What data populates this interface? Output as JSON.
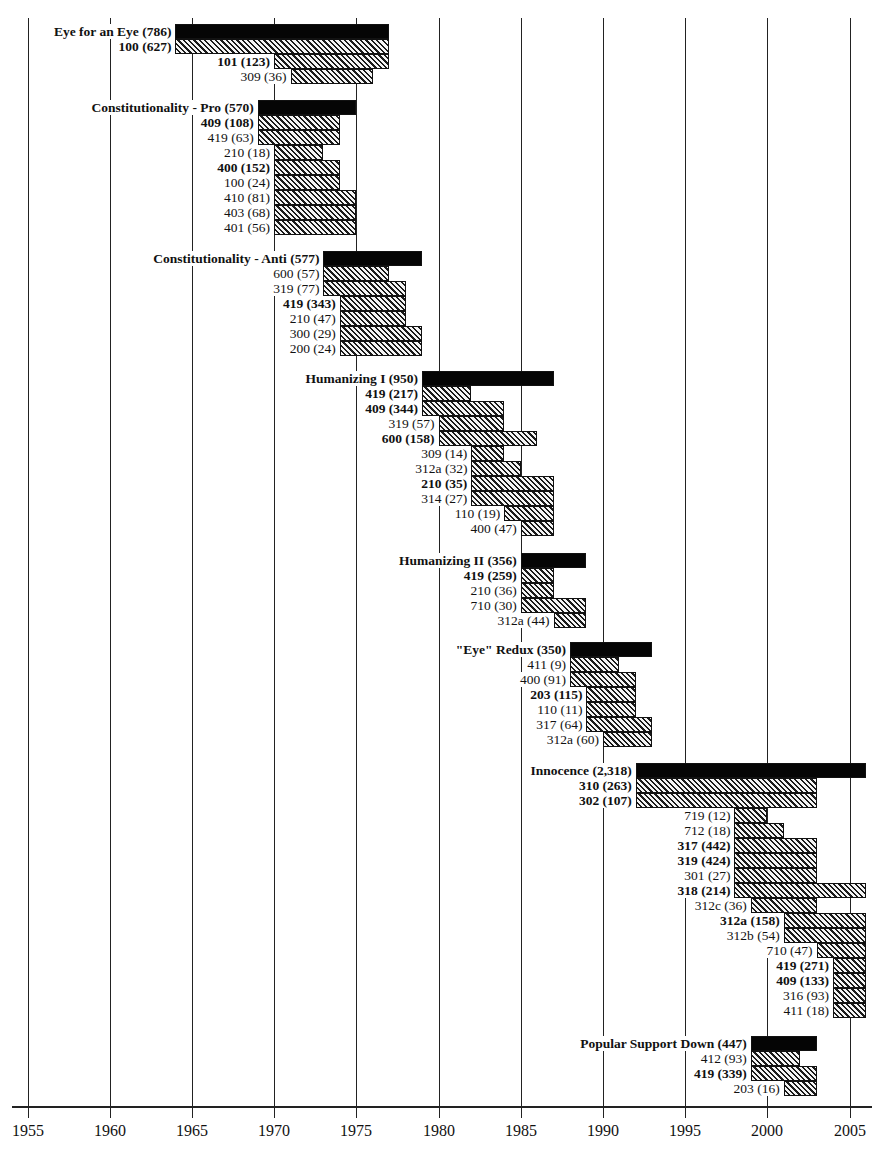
{
  "chart_data": {
    "type": "bar",
    "subtype": "horizontal-timeline-gantt",
    "title": "",
    "xlabel": "",
    "ylabel": "",
    "xlim": [
      1955,
      2006
    ],
    "x_ticks": [
      1955,
      1960,
      1965,
      1970,
      1975,
      1980,
      1985,
      1990,
      1995,
      2000,
      2005
    ],
    "grid": "vertical lines at each 5-year tick",
    "legend": "none",
    "styles": {
      "total_bar_color": "#050505",
      "sub_bar": "diagonal hatch (black on light gray)",
      "gridline_color": "#222222"
    },
    "groups": [
      {
        "name": "Eye for an Eye",
        "total": 786,
        "start": 1964,
        "end": 1977,
        "y": 24,
        "items": [
          {
            "code": "100",
            "count": 627,
            "bold": true,
            "start": 1964,
            "end": 1977
          },
          {
            "code": "101",
            "count": 123,
            "bold": true,
            "start": 1970,
            "end": 1977
          },
          {
            "code": "309",
            "count": 36,
            "bold": false,
            "start": 1971,
            "end": 1976
          }
        ]
      },
      {
        "name": "Constitutionality - Pro",
        "total": 570,
        "start": 1969,
        "end": 1975,
        "y": 100,
        "items": [
          {
            "code": "409",
            "count": 108,
            "bold": true,
            "start": 1969,
            "end": 1974
          },
          {
            "code": "419",
            "count": 63,
            "bold": false,
            "start": 1969,
            "end": 1974
          },
          {
            "code": "210",
            "count": 18,
            "bold": false,
            "start": 1970,
            "end": 1973
          },
          {
            "code": "400",
            "count": 152,
            "bold": true,
            "start": 1970,
            "end": 1974
          },
          {
            "code": "100",
            "count": 24,
            "bold": false,
            "start": 1970,
            "end": 1974
          },
          {
            "code": "410",
            "count": 81,
            "bold": false,
            "start": 1970,
            "end": 1975
          },
          {
            "code": "403",
            "count": 68,
            "bold": false,
            "start": 1970,
            "end": 1975
          },
          {
            "code": "401",
            "count": 56,
            "bold": false,
            "start": 1970,
            "end": 1975
          }
        ]
      },
      {
        "name": "Constitutionality - Anti",
        "total": 577,
        "start": 1973,
        "end": 1979,
        "y": 251,
        "items": [
          {
            "code": "600",
            "count": 57,
            "bold": false,
            "start": 1973,
            "end": 1977
          },
          {
            "code": "319",
            "count": 77,
            "bold": false,
            "start": 1973,
            "end": 1978
          },
          {
            "code": "419",
            "count": 343,
            "bold": true,
            "start": 1974,
            "end": 1978
          },
          {
            "code": "210",
            "count": 47,
            "bold": false,
            "start": 1974,
            "end": 1978
          },
          {
            "code": "300",
            "count": 29,
            "bold": false,
            "start": 1974,
            "end": 1979
          },
          {
            "code": "200",
            "count": 24,
            "bold": false,
            "start": 1974,
            "end": 1979
          }
        ]
      },
      {
        "name": "Humanizing I",
        "total": 950,
        "start": 1979,
        "end": 1987,
        "y": 371,
        "items": [
          {
            "code": "419",
            "count": 217,
            "bold": true,
            "start": 1979,
            "end": 1982
          },
          {
            "code": "409",
            "count": 344,
            "bold": true,
            "start": 1979,
            "end": 1984
          },
          {
            "code": "319",
            "count": 57,
            "bold": false,
            "start": 1980,
            "end": 1984
          },
          {
            "code": "600",
            "count": 158,
            "bold": true,
            "start": 1980,
            "end": 1986
          },
          {
            "code": "309",
            "count": 14,
            "bold": false,
            "start": 1982,
            "end": 1984
          },
          {
            "code": "312a",
            "count": 32,
            "bold": false,
            "start": 1982,
            "end": 1985
          },
          {
            "code": "210",
            "count": 35,
            "bold": true,
            "start": 1982,
            "end": 1987
          },
          {
            "code": "314",
            "count": 27,
            "bold": false,
            "start": 1982,
            "end": 1987
          },
          {
            "code": "110",
            "count": 19,
            "bold": false,
            "start": 1984,
            "end": 1987
          },
          {
            "code": "400",
            "count": 47,
            "bold": false,
            "start": 1985,
            "end": 1987
          }
        ]
      },
      {
        "name": "Humanizing II",
        "total": 356,
        "start": 1985,
        "end": 1989,
        "y": 553,
        "items": [
          {
            "code": "419",
            "count": 259,
            "bold": true,
            "start": 1985,
            "end": 1987
          },
          {
            "code": "210",
            "count": 36,
            "bold": false,
            "start": 1985,
            "end": 1987
          },
          {
            "code": "710",
            "count": 30,
            "bold": false,
            "start": 1985,
            "end": 1989
          },
          {
            "code": "312a",
            "count": 44,
            "bold": false,
            "start": 1987,
            "end": 1989
          }
        ]
      },
      {
        "name": "\"Eye\" Redux",
        "total": 350,
        "start": 1988,
        "end": 1993,
        "y": 642,
        "items": [
          {
            "code": "411",
            "count": 9,
            "bold": false,
            "start": 1988,
            "end": 1991
          },
          {
            "code": "400",
            "count": 91,
            "bold": false,
            "start": 1988,
            "end": 1992
          },
          {
            "code": "203",
            "count": 115,
            "bold": true,
            "start": 1989,
            "end": 1992
          },
          {
            "code": "110",
            "count": 11,
            "bold": false,
            "start": 1989,
            "end": 1992
          },
          {
            "code": "317",
            "count": 64,
            "bold": false,
            "start": 1989,
            "end": 1993
          },
          {
            "code": "312a",
            "count": 60,
            "bold": false,
            "start": 1990,
            "end": 1993
          }
        ]
      },
      {
        "name": "Innocence",
        "total": 2318,
        "total_label": "2,318",
        "start": 1992,
        "end": 2006,
        "y": 763,
        "items": [
          {
            "code": "310",
            "count": 263,
            "bold": true,
            "start": 1992,
            "end": 2003
          },
          {
            "code": "302",
            "count": 107,
            "bold": true,
            "start": 1992,
            "end": 2003
          },
          {
            "code": "719",
            "count": 12,
            "bold": false,
            "start": 1998,
            "end": 2000
          },
          {
            "code": "712",
            "count": 18,
            "bold": false,
            "start": 1998,
            "end": 2001
          },
          {
            "code": "317",
            "count": 442,
            "bold": true,
            "start": 1998,
            "end": 2003
          },
          {
            "code": "319",
            "count": 424,
            "bold": true,
            "start": 1998,
            "end": 2003
          },
          {
            "code": "301",
            "count": 27,
            "bold": false,
            "start": 1998,
            "end": 2003
          },
          {
            "code": "318",
            "count": 214,
            "bold": true,
            "start": 1998,
            "end": 2006
          },
          {
            "code": "312c",
            "count": 36,
            "bold": false,
            "start": 1999,
            "end": 2003
          },
          {
            "code": "312a",
            "count": 158,
            "bold": true,
            "start": 2001,
            "end": 2006
          },
          {
            "code": "312b",
            "count": 54,
            "bold": false,
            "start": 2001,
            "end": 2006
          },
          {
            "code": "710",
            "count": 47,
            "bold": false,
            "start": 2003,
            "end": 2006
          },
          {
            "code": "419",
            "count": 271,
            "bold": true,
            "start": 2004,
            "end": 2006
          },
          {
            "code": "409",
            "count": 133,
            "bold": true,
            "start": 2004,
            "end": 2006
          },
          {
            "code": "316",
            "count": 93,
            "bold": false,
            "start": 2004,
            "end": 2006
          },
          {
            "code": "411",
            "count": 18,
            "bold": false,
            "start": 2004,
            "end": 2006
          }
        ]
      },
      {
        "name": "Popular Support Down",
        "total": 447,
        "start": 1999,
        "end": 2003,
        "y": 1036,
        "items": [
          {
            "code": "412",
            "count": 93,
            "bold": false,
            "start": 1999,
            "end": 2002
          },
          {
            "code": "419",
            "count": 339,
            "bold": true,
            "start": 1999,
            "end": 2003
          },
          {
            "code": "203",
            "count": 16,
            "bold": false,
            "start": 2001,
            "end": 2003
          }
        ]
      }
    ]
  },
  "layout": {
    "x0_year": 1955,
    "x0_px": 27.5,
    "px_per_year": 16.44,
    "row_height": 15,
    "axis_y": 1106,
    "grid_top": 18
  }
}
